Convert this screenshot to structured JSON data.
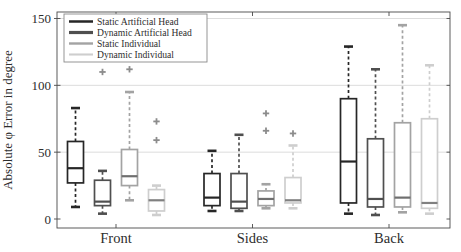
{
  "figure": {
    "ylabel": "Absolute φ Error in degree",
    "y_tick_labels": [
      "0",
      "50",
      "100",
      "150"
    ],
    "frame_color": "#4a4a4a",
    "grid_color": "#dddddd",
    "outlier_color": "#8c8c8c",
    "legend_border_color": "#8a8a8a"
  },
  "chart_data": {
    "type": "boxplot",
    "title": "",
    "xlabel": "",
    "ylabel": "Absolute φ Error in degree",
    "categories": [
      "Front",
      "Sides",
      "Back"
    ],
    "y_ticks": [
      0,
      50,
      100,
      150
    ],
    "ylim": [
      -7,
      155
    ],
    "grid": "horizontal gridlines at 50, 100, 150",
    "legend_position": "top-left",
    "series": [
      {
        "name": "Static Artificial Head",
        "color": "#262626",
        "median_color": "#262626",
        "boxes": [
          {
            "category": "Front",
            "whisker_low": 9,
            "q1": 27,
            "median": 38,
            "q3": 58,
            "whisker_high": 83,
            "outliers": []
          },
          {
            "category": "Sides",
            "whisker_low": 6,
            "q1": 10,
            "median": 16,
            "q3": 34,
            "whisker_high": 51,
            "outliers": []
          },
          {
            "category": "Back",
            "whisker_low": 4,
            "q1": 12,
            "median": 43,
            "q3": 90,
            "whisker_high": 129,
            "outliers": []
          }
        ]
      },
      {
        "name": "Dynamic Artificial Head",
        "color": "#4f4f4f",
        "median_color": "#4f4f4f",
        "boxes": [
          {
            "category": "Front",
            "whisker_low": 4,
            "q1": 10,
            "median": 13,
            "q3": 29,
            "whisker_high": 36,
            "outliers": [
              110
            ]
          },
          {
            "category": "Sides",
            "whisker_low": 6,
            "q1": 8,
            "median": 13,
            "q3": 34,
            "whisker_high": 63,
            "outliers": []
          },
          {
            "category": "Back",
            "whisker_low": 3,
            "q1": 9,
            "median": 15,
            "q3": 60,
            "whisker_high": 112,
            "outliers": []
          }
        ]
      },
      {
        "name": "Static Individual",
        "color": "#a3a3a3",
        "median_color": "#6f6f6f",
        "boxes": [
          {
            "category": "Front",
            "whisker_low": 14,
            "q1": 25,
            "median": 32,
            "q3": 52,
            "whisker_high": 95,
            "outliers": [
              112
            ]
          },
          {
            "category": "Sides",
            "whisker_low": 8,
            "q1": 10,
            "median": 15,
            "q3": 21,
            "whisker_high": 26,
            "outliers": [
              66,
              79
            ]
          },
          {
            "category": "Back",
            "whisker_low": 5,
            "q1": 9,
            "median": 16,
            "q3": 72,
            "whisker_high": 145,
            "outliers": []
          }
        ]
      },
      {
        "name": "Dynamic Individual",
        "color": "#cecece",
        "median_color": "#808080",
        "boxes": [
          {
            "category": "Front",
            "whisker_low": 3,
            "q1": 6,
            "median": 14,
            "q3": 22,
            "whisker_high": 25,
            "outliers": [
              59,
              73
            ]
          },
          {
            "category": "Sides",
            "whisker_low": 8,
            "q1": 12,
            "median": 14,
            "q3": 31,
            "whisker_high": 55,
            "outliers": [
              64
            ]
          },
          {
            "category": "Back",
            "whisker_low": 4,
            "q1": 8,
            "median": 12,
            "q3": 75,
            "whisker_high": 115,
            "outliers": []
          }
        ]
      }
    ]
  }
}
